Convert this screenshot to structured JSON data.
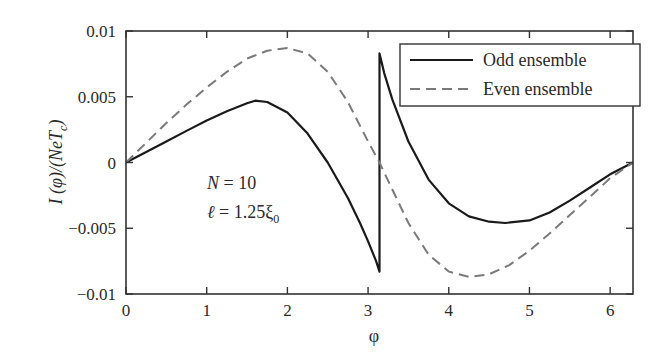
{
  "chart_data": {
    "type": "line",
    "title": "",
    "xlabel": "φ",
    "ylabel": "I (φ)/(NeT_c)",
    "ylabel_parts": {
      "main": "I (φ)/(NeT",
      "sub": "c",
      "close": ")"
    },
    "xlim": [
      0,
      6.2832
    ],
    "ylim": [
      -0.01,
      0.01
    ],
    "x_ticks": [
      0,
      1,
      2,
      3,
      4,
      5,
      6
    ],
    "x_tick_labels": [
      "0",
      "1",
      "2",
      "3",
      "4",
      "5",
      "6"
    ],
    "y_ticks": [
      0.01,
      0.005,
      0,
      -0.005,
      -0.01
    ],
    "y_tick_labels": [
      "0.01",
      "0.005",
      "0",
      "−0.005",
      "−0.01"
    ],
    "grid": false,
    "legend_position": "upper right",
    "series": [
      {
        "name": "Odd ensemble",
        "style": "solid",
        "color": "#1a1a1a",
        "x": [
          0,
          0.25,
          0.5,
          0.75,
          1.0,
          1.25,
          1.5,
          1.6,
          1.75,
          2.0,
          2.25,
          2.5,
          2.75,
          2.9,
          3.0,
          3.1,
          3.14159,
          3.14159,
          3.2,
          3.3,
          3.5,
          3.75,
          4.0,
          4.25,
          4.5,
          4.7,
          5.0,
          5.25,
          5.5,
          5.75,
          6.0,
          6.2832
        ],
        "y": [
          0,
          0.0008,
          0.0016,
          0.0024,
          0.0032,
          0.0039,
          0.0045,
          0.0047,
          0.0046,
          0.0038,
          0.0022,
          0.0,
          -0.0027,
          -0.0046,
          -0.006,
          -0.0075,
          -0.0083,
          0.0083,
          0.0068,
          0.0048,
          0.0016,
          -0.0013,
          -0.0031,
          -0.0041,
          -0.0045,
          -0.0046,
          -0.0044,
          -0.0038,
          -0.0029,
          -0.0019,
          -0.0009,
          0
        ]
      },
      {
        "name": "Even ensemble",
        "style": "dashed",
        "color": "#7a7a7a",
        "x": [
          0,
          0.25,
          0.5,
          0.75,
          1.0,
          1.25,
          1.5,
          1.75,
          2.0,
          2.25,
          2.5,
          2.75,
          3.0,
          3.14159,
          3.25,
          3.5,
          3.75,
          4.0,
          4.25,
          4.5,
          4.75,
          5.0,
          5.25,
          5.5,
          5.75,
          6.0,
          6.2832
        ],
        "y": [
          0,
          0.0015,
          0.003,
          0.0044,
          0.0057,
          0.0069,
          0.0079,
          0.0085,
          0.0087,
          0.0083,
          0.0069,
          0.0046,
          0.0016,
          0,
          -0.0014,
          -0.0046,
          -0.007,
          -0.0083,
          -0.0087,
          -0.0085,
          -0.0078,
          -0.0067,
          -0.0054,
          -0.004,
          -0.0026,
          -0.0012,
          0
        ]
      }
    ],
    "annotations": [
      {
        "text": "N = 10",
        "x": 1.15,
        "y": -0.0026
      },
      {
        "text": "ℓ = 1.25ξ₀",
        "x": 1.15,
        "y": -0.0049
      }
    ]
  },
  "legend": {
    "odd_label": "Odd ensemble",
    "even_label": "Even ensemble"
  },
  "annotation": {
    "n_prefix": "N",
    "n_value": " = 10",
    "l_prefix": "ℓ",
    "l_value": " = 1.25ξ",
    "l_sub": "0"
  },
  "axes": {
    "x_label": "φ"
  }
}
